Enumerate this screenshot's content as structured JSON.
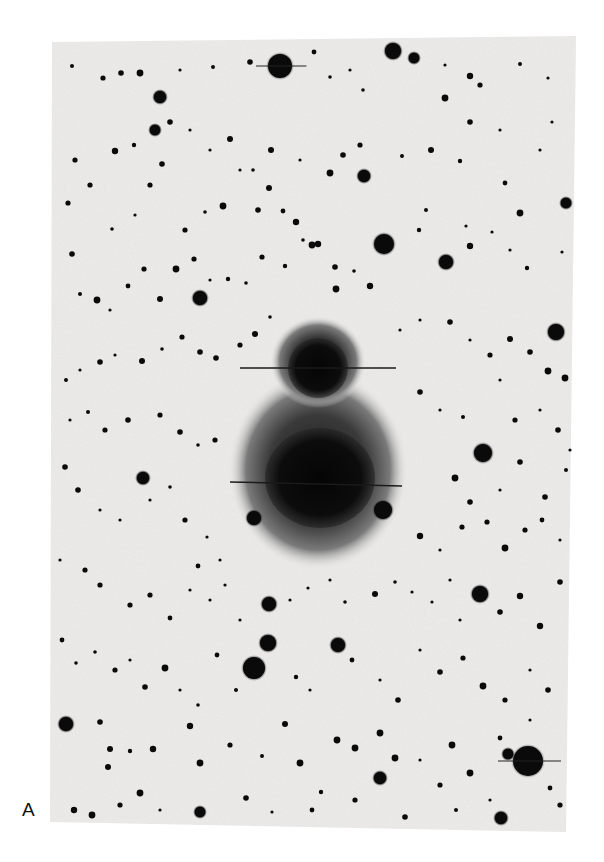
{
  "figure": {
    "panel_label": "A",
    "colors": {
      "page_background": "#ffffff",
      "plate_background": "#ecebea",
      "star": "#0a0a0a",
      "nebula_core": "#0c0c0c",
      "nebula_halo": "#6a6a6a"
    },
    "plate": {
      "corners": [
        [
          52,
          42
        ],
        [
          576,
          36
        ],
        [
          566,
          832
        ],
        [
          50,
          822
        ]
      ]
    },
    "nebula": {
      "upper_core": {
        "cx": 318,
        "cy": 368,
        "rx": 30,
        "ry": 30
      },
      "lower_core": {
        "cx": 320,
        "cy": 478,
        "rx": 55,
        "ry": 50
      },
      "halo": {
        "cx": 318,
        "cy": 470,
        "rx": 90,
        "ry": 100
      },
      "upper_halo": {
        "cx": 318,
        "cy": 362,
        "rx": 48,
        "ry": 46
      },
      "spikes": [
        {
          "x1": 240,
          "y1": 368,
          "x2": 396,
          "y2": 368
        },
        {
          "x1": 230,
          "y1": 482,
          "x2": 402,
          "y2": 486
        }
      ]
    },
    "bright_stars": [
      {
        "cx": 280,
        "cy": 66,
        "r": 12
      },
      {
        "cx": 393,
        "cy": 51,
        "r": 8
      },
      {
        "cx": 414,
        "cy": 58,
        "r": 5
      },
      {
        "cx": 384,
        "cy": 244,
        "r": 10
      },
      {
        "cx": 200,
        "cy": 298,
        "r": 7
      },
      {
        "cx": 556,
        "cy": 332,
        "r": 8
      },
      {
        "cx": 483,
        "cy": 453,
        "r": 9
      },
      {
        "cx": 254,
        "cy": 518,
        "r": 7
      },
      {
        "cx": 383,
        "cy": 510,
        "r": 9
      },
      {
        "cx": 269,
        "cy": 604,
        "r": 7
      },
      {
        "cx": 268,
        "cy": 643,
        "r": 8
      },
      {
        "cx": 254,
        "cy": 668,
        "r": 11
      },
      {
        "cx": 480,
        "cy": 594,
        "r": 8
      },
      {
        "cx": 338,
        "cy": 645,
        "r": 7
      },
      {
        "cx": 528,
        "cy": 761,
        "r": 15
      },
      {
        "cx": 66,
        "cy": 724,
        "r": 7
      },
      {
        "cx": 143,
        "cy": 478,
        "r": 6
      },
      {
        "cx": 446,
        "cy": 262,
        "r": 7
      },
      {
        "cx": 364,
        "cy": 176,
        "r": 6
      },
      {
        "cx": 160,
        "cy": 97,
        "r": 6
      },
      {
        "cx": 155,
        "cy": 130,
        "r": 5
      },
      {
        "cx": 566,
        "cy": 203,
        "r": 5
      },
      {
        "cx": 508,
        "cy": 754,
        "r": 5
      },
      {
        "cx": 501,
        "cy": 818,
        "r": 6
      },
      {
        "cx": 380,
        "cy": 778,
        "r": 6
      },
      {
        "cx": 200,
        "cy": 812,
        "r": 5
      }
    ],
    "small_stars": [
      [
        72,
        66
      ],
      [
        103,
        78
      ],
      [
        121,
        73
      ],
      [
        140,
        73
      ],
      [
        180,
        70
      ],
      [
        213,
        67
      ],
      [
        250,
        62
      ],
      [
        314,
        52
      ],
      [
        330,
        77
      ],
      [
        350,
        70
      ],
      [
        363,
        90
      ],
      [
        445,
        65
      ],
      [
        470,
        76
      ],
      [
        480,
        85
      ],
      [
        520,
        64
      ],
      [
        548,
        78
      ],
      [
        500,
        130
      ],
      [
        470,
        122
      ],
      [
        445,
        98
      ],
      [
        75,
        160
      ],
      [
        115,
        151
      ],
      [
        134,
        145
      ],
      [
        170,
        122
      ],
      [
        190,
        130
      ],
      [
        210,
        150
      ],
      [
        230,
        139
      ],
      [
        253,
        170
      ],
      [
        271,
        150
      ],
      [
        300,
        160
      ],
      [
        330,
        173
      ],
      [
        343,
        155
      ],
      [
        360,
        145
      ],
      [
        402,
        156
      ],
      [
        431,
        150
      ],
      [
        460,
        161
      ],
      [
        505,
        183
      ],
      [
        520,
        213
      ],
      [
        540,
        150
      ],
      [
        552,
        122
      ],
      [
        68,
        203
      ],
      [
        90,
        185
      ],
      [
        112,
        229
      ],
      [
        135,
        215
      ],
      [
        150,
        185
      ],
      [
        162,
        164
      ],
      [
        185,
        230
      ],
      [
        205,
        212
      ],
      [
        223,
        206
      ],
      [
        240,
        170
      ],
      [
        258,
        210
      ],
      [
        269,
        188
      ],
      [
        283,
        211
      ],
      [
        296,
        222
      ],
      [
        318,
        244
      ],
      [
        335,
        267
      ],
      [
        354,
        271
      ],
      [
        370,
        286
      ],
      [
        336,
        289
      ],
      [
        312,
        245
      ],
      [
        72,
        254
      ],
      [
        80,
        294
      ],
      [
        97,
        300
      ],
      [
        110,
        310
      ],
      [
        128,
        286
      ],
      [
        144,
        269
      ],
      [
        160,
        299
      ],
      [
        176,
        269
      ],
      [
        194,
        259
      ],
      [
        210,
        280
      ],
      [
        228,
        279
      ],
      [
        246,
        283
      ],
      [
        262,
        257
      ],
      [
        285,
        266
      ],
      [
        303,
        240
      ],
      [
        426,
        210
      ],
      [
        419,
        230
      ],
      [
        466,
        226
      ],
      [
        470,
        246
      ],
      [
        492,
        232
      ],
      [
        510,
        250
      ],
      [
        527,
        268
      ],
      [
        562,
        252
      ],
      [
        66,
        380
      ],
      [
        80,
        370
      ],
      [
        100,
        362
      ],
      [
        115,
        355
      ],
      [
        142,
        361
      ],
      [
        162,
        349
      ],
      [
        182,
        337
      ],
      [
        200,
        352
      ],
      [
        216,
        358
      ],
      [
        240,
        345
      ],
      [
        255,
        334
      ],
      [
        270,
        317
      ],
      [
        400,
        330
      ],
      [
        420,
        320
      ],
      [
        450,
        322
      ],
      [
        470,
        340
      ],
      [
        490,
        355
      ],
      [
        510,
        339
      ],
      [
        530,
        352
      ],
      [
        548,
        371
      ],
      [
        565,
        378
      ],
      [
        70,
        420
      ],
      [
        88,
        412
      ],
      [
        105,
        430
      ],
      [
        128,
        420
      ],
      [
        160,
        415
      ],
      [
        180,
        432
      ],
      [
        198,
        445
      ],
      [
        215,
        440
      ],
      [
        420,
        392
      ],
      [
        440,
        410
      ],
      [
        463,
        417
      ],
      [
        500,
        380
      ],
      [
        515,
        420
      ],
      [
        540,
        410
      ],
      [
        558,
        430
      ],
      [
        570,
        450
      ],
      [
        455,
        478
      ],
      [
        470,
        502
      ],
      [
        500,
        490
      ],
      [
        520,
        462
      ],
      [
        545,
        497
      ],
      [
        566,
        470
      ],
      [
        65,
        467
      ],
      [
        78,
        490
      ],
      [
        100,
        510
      ],
      [
        120,
        520
      ],
      [
        150,
        500
      ],
      [
        170,
        487
      ],
      [
        185,
        520
      ],
      [
        207,
        537
      ],
      [
        220,
        560
      ],
      [
        198,
        566
      ],
      [
        420,
        536
      ],
      [
        440,
        550
      ],
      [
        462,
        527
      ],
      [
        487,
        522
      ],
      [
        505,
        548
      ],
      [
        525,
        530
      ],
      [
        542,
        520
      ],
      [
        560,
        540
      ],
      [
        60,
        560
      ],
      [
        85,
        570
      ],
      [
        100,
        585
      ],
      [
        130,
        605
      ],
      [
        150,
        595
      ],
      [
        170,
        618
      ],
      [
        190,
        590
      ],
      [
        210,
        600
      ],
      [
        225,
        585
      ],
      [
        240,
        620
      ],
      [
        290,
        600
      ],
      [
        308,
        588
      ],
      [
        330,
        580
      ],
      [
        345,
        602
      ],
      [
        375,
        594
      ],
      [
        395,
        582
      ],
      [
        412,
        592
      ],
      [
        432,
        602
      ],
      [
        450,
        580
      ],
      [
        460,
        620
      ],
      [
        500,
        612
      ],
      [
        520,
        596
      ],
      [
        540,
        626
      ],
      [
        560,
        582
      ],
      [
        62,
        640
      ],
      [
        76,
        663
      ],
      [
        95,
        652
      ],
      [
        115,
        670
      ],
      [
        130,
        660
      ],
      [
        145,
        687
      ],
      [
        165,
        668
      ],
      [
        180,
        690
      ],
      [
        198,
        705
      ],
      [
        217,
        655
      ],
      [
        236,
        690
      ],
      [
        296,
        677
      ],
      [
        310,
        690
      ],
      [
        352,
        660
      ],
      [
        380,
        680
      ],
      [
        398,
        700
      ],
      [
        420,
        650
      ],
      [
        440,
        672
      ],
      [
        463,
        658
      ],
      [
        483,
        686
      ],
      [
        505,
        700
      ],
      [
        530,
        670
      ],
      [
        548,
        690
      ],
      [
        100,
        722
      ],
      [
        110,
        749
      ],
      [
        108,
        767
      ],
      [
        130,
        751
      ],
      [
        153,
        749
      ],
      [
        140,
        793
      ],
      [
        190,
        726
      ],
      [
        200,
        763
      ],
      [
        230,
        745
      ],
      [
        262,
        756
      ],
      [
        285,
        724
      ],
      [
        300,
        763
      ],
      [
        321,
        792
      ],
      [
        337,
        740
      ],
      [
        355,
        748
      ],
      [
        380,
        733
      ],
      [
        395,
        758
      ],
      [
        420,
        760
      ],
      [
        440,
        785
      ],
      [
        452,
        745
      ],
      [
        470,
        773
      ],
      [
        500,
        738
      ],
      [
        530,
        720
      ],
      [
        550,
        788
      ],
      [
        560,
        805
      ],
      [
        490,
        800
      ],
      [
        456,
        810
      ],
      [
        405,
        817
      ],
      [
        355,
        800
      ],
      [
        312,
        810
      ],
      [
        272,
        812
      ],
      [
        246,
        798
      ],
      [
        160,
        810
      ],
      [
        120,
        805
      ],
      [
        92,
        815
      ],
      [
        74,
        810
      ]
    ]
  }
}
